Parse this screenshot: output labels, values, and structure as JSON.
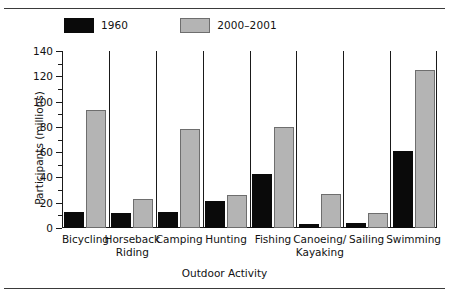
{
  "figure": {
    "ylabel": "Participants (millions)",
    "xlabel": "Outdoor Activity"
  },
  "legend": {
    "items": [
      {
        "label": "1960",
        "color": "#0a0a0a",
        "key": "1960"
      },
      {
        "label": "2000–2001",
        "color": "#b4b4b4",
        "key": "2000-2001"
      }
    ]
  },
  "yaxis": {
    "ticks": [
      "0",
      "20",
      "40",
      "60",
      "80",
      "100",
      "120",
      "140"
    ]
  },
  "chart_data": {
    "type": "bar",
    "title": "",
    "xlabel": "Outdoor Activity",
    "ylabel": "Participants (millions)",
    "ylim": [
      0,
      140
    ],
    "ytick_step": 20,
    "yminor_step": 10,
    "grid": false,
    "legend_position": "top-left",
    "categories": [
      "Bicycling",
      "Horseback\nRiding",
      "Camping",
      "Hunting",
      "Fishing",
      "Canoeing/\nKayaking",
      "Sailing",
      "Swimming"
    ],
    "series": [
      {
        "name": "1960",
        "color": "#0a0a0a",
        "values": [
          13,
          12,
          13,
          21,
          43,
          3,
          4,
          61
        ]
      },
      {
        "name": "2000–2001",
        "color": "#b4b4b4",
        "values": [
          93,
          23,
          78,
          26,
          80,
          27,
          12,
          125
        ]
      }
    ]
  }
}
